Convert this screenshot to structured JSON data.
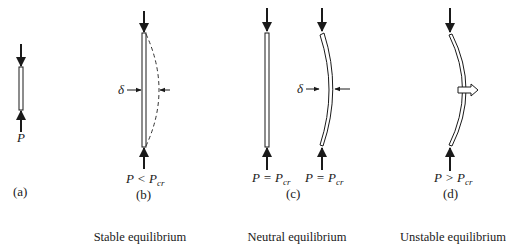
{
  "figure": {
    "panels": [
      {
        "id": "a",
        "label": "(a)",
        "load_label": "P",
        "load_sub": ""
      },
      {
        "id": "b",
        "label": "(b)",
        "load_label": "P < P",
        "load_sub": "cr",
        "delta_label": "δ"
      },
      {
        "id": "c",
        "label": "(c)",
        "columns": [
          {
            "load_label": "P = P",
            "load_sub": "cr"
          },
          {
            "load_label": "P = P",
            "load_sub": "cr",
            "delta_label": "δ"
          }
        ]
      },
      {
        "id": "d",
        "label": "(d)",
        "load_label": "P > P",
        "load_sub": "cr"
      }
    ],
    "captions": {
      "stable": "Stable equilibrium",
      "neutral": "Neutral equilibrium",
      "unstable": "Unstable equilibrium"
    },
    "colors": {
      "ink": "#1a1a1a",
      "background": "#ffffff"
    }
  }
}
